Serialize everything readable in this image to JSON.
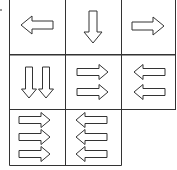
{
  "puzzle": {
    "rows": 3,
    "cols": 3,
    "cells": [
      {
        "row": 0,
        "col": 0,
        "direction": "left",
        "count": 1,
        "layout": "single"
      },
      {
        "row": 0,
        "col": 1,
        "direction": "down",
        "count": 1,
        "layout": "single"
      },
      {
        "row": 0,
        "col": 2,
        "direction": "right",
        "count": 1,
        "layout": "single"
      },
      {
        "row": 1,
        "col": 0,
        "direction": "down",
        "count": 2,
        "layout": "horizontal"
      },
      {
        "row": 1,
        "col": 1,
        "direction": "right",
        "count": 2,
        "layout": "vertical"
      },
      {
        "row": 1,
        "col": 2,
        "direction": "left",
        "count": 2,
        "layout": "vertical"
      },
      {
        "row": 2,
        "col": 0,
        "direction": "right",
        "count": 3,
        "layout": "vertical"
      },
      {
        "row": 2,
        "col": 1,
        "direction": "left",
        "count": 3,
        "layout": "vertical"
      },
      {
        "row": 2,
        "col": 2,
        "direction": "none",
        "count": 0,
        "layout": "missing"
      }
    ],
    "stroke_color": "#333333",
    "grid_color": "#333333",
    "fill_color": "#ffffff"
  }
}
